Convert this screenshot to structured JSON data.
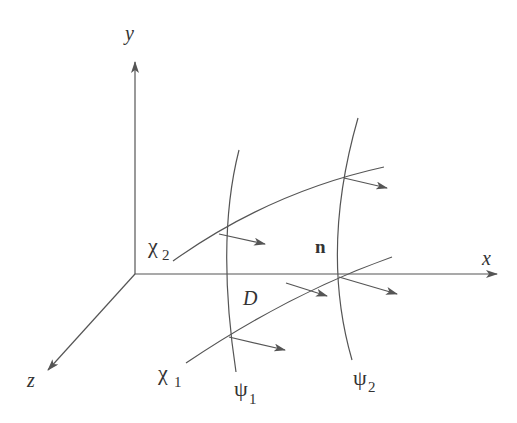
{
  "diagram": {
    "colors": {
      "line": "#555555",
      "text": "#333333",
      "background": "#ffffff"
    },
    "axes": {
      "x_label": "x",
      "y_label": "y",
      "z_label": "z"
    },
    "curves": {
      "chi1_label": "χ",
      "chi1_sub": "1",
      "chi2_label": "χ",
      "chi2_sub": "2",
      "psi1_label": "ψ",
      "psi1_sub": "1",
      "psi2_label": "ψ",
      "psi2_sub": "2"
    },
    "region_label": "D",
    "normal_label": "n"
  }
}
